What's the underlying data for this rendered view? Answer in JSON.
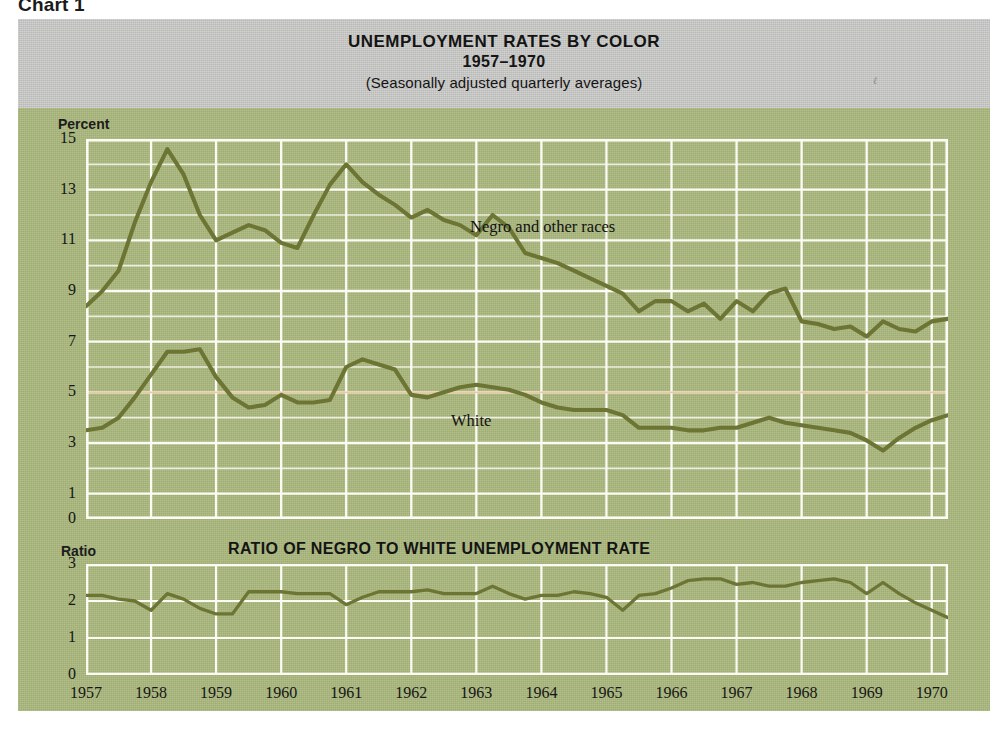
{
  "chart_number": "Chart 1",
  "header": {
    "title_line1": "UNEMPLOYMENT RATES BY COLOR",
    "title_line2": "1957–1970",
    "title_line3": "(Seasonally adjusted quarterly averages)",
    "smudge_mark": "ℓ"
  },
  "colors": {
    "page_background": "#ffffff",
    "figure_background": "#aab87d",
    "header_band": "#c9c9c7",
    "line": "#6d7535",
    "gridline": "#fbfbf4",
    "reference_line": "#e8c39a",
    "text": "#141414"
  },
  "main_panel": {
    "y_axis_caption": "Percent",
    "y_tick_labels": [
      "15",
      "13",
      "11",
      "9",
      "7",
      "5",
      "3",
      "1",
      "0"
    ],
    "series_label_negro": "Negro and other races",
    "series_label_white": "White"
  },
  "ratio_panel": {
    "y_axis_caption": "Ratio",
    "panel_title": "RATIO OF NEGRO TO WHITE UNEMPLOYMENT RATE",
    "y_tick_labels": [
      "3",
      "2",
      "1",
      "0"
    ]
  },
  "x_axis": {
    "tick_labels": [
      "1957",
      "1958",
      "1959",
      "1960",
      "1961",
      "1962",
      "1963",
      "1964",
      "1965",
      "1966",
      "1967",
      "1968",
      "1969",
      "1970"
    ]
  },
  "chart_data": [
    {
      "type": "line",
      "title": "UNEMPLOYMENT RATES BY COLOR",
      "subtitle": "1957–1970 (Seasonally adjusted quarterly averages)",
      "xlabel": "",
      "ylabel": "Percent",
      "ylim": [
        0,
        15
      ],
      "xlim": [
        1957.0,
        1970.25
      ],
      "grid": true,
      "legend": "inline annotations",
      "x": [
        1957.0,
        1957.25,
        1957.5,
        1957.75,
        1958.0,
        1958.25,
        1958.5,
        1958.75,
        1959.0,
        1959.25,
        1959.5,
        1959.75,
        1960.0,
        1960.25,
        1960.5,
        1960.75,
        1961.0,
        1961.25,
        1961.5,
        1961.75,
        1962.0,
        1962.25,
        1962.5,
        1962.75,
        1963.0,
        1963.25,
        1963.5,
        1963.75,
        1964.0,
        1964.25,
        1964.5,
        1964.75,
        1965.0,
        1965.25,
        1965.5,
        1965.75,
        1966.0,
        1966.25,
        1966.5,
        1966.75,
        1967.0,
        1967.25,
        1967.5,
        1967.75,
        1968.0,
        1968.25,
        1968.5,
        1968.75,
        1969.0,
        1969.25,
        1969.5,
        1969.75,
        1970.0,
        1970.25
      ],
      "series": [
        {
          "name": "Negro and other races",
          "values": [
            8.4,
            9.0,
            9.8,
            11.7,
            13.3,
            14.6,
            13.6,
            12.0,
            11.0,
            11.3,
            11.6,
            11.4,
            10.9,
            10.7,
            12.0,
            13.2,
            14.0,
            13.3,
            12.8,
            12.4,
            11.9,
            12.2,
            11.8,
            11.6,
            11.2,
            12.0,
            11.5,
            10.5,
            10.3,
            10.1,
            9.8,
            9.5,
            9.2,
            8.9,
            8.2,
            8.6,
            8.6,
            8.2,
            8.5,
            7.9,
            8.6,
            8.2,
            8.9,
            9.1,
            7.8,
            7.7,
            7.5,
            7.6,
            7.2,
            7.8,
            7.5,
            7.4,
            7.8,
            7.9
          ]
        },
        {
          "name": "White",
          "values": [
            3.5,
            3.6,
            4.0,
            4.8,
            5.7,
            6.6,
            6.6,
            6.7,
            5.6,
            4.8,
            4.4,
            4.5,
            4.9,
            4.6,
            4.6,
            4.7,
            6.0,
            6.3,
            6.1,
            5.9,
            4.9,
            4.8,
            5.0,
            5.2,
            5.3,
            5.2,
            5.1,
            4.9,
            4.6,
            4.4,
            4.3,
            4.3,
            4.3,
            4.1,
            3.6,
            3.6,
            3.6,
            3.5,
            3.5,
            3.6,
            3.6,
            3.8,
            4.0,
            3.8,
            3.7,
            3.6,
            3.5,
            3.4,
            3.1,
            2.7,
            3.2,
            3.6,
            3.9,
            4.1
          ]
        }
      ]
    },
    {
      "type": "line",
      "title": "RATIO OF NEGRO TO WHITE UNEMPLOYMENT RATE",
      "xlabel": "",
      "ylabel": "Ratio",
      "ylim": [
        0,
        3
      ],
      "xlim": [
        1957.0,
        1970.25
      ],
      "grid": true,
      "x": [
        1957.0,
        1957.25,
        1957.5,
        1957.75,
        1958.0,
        1958.25,
        1958.5,
        1958.75,
        1959.0,
        1959.25,
        1959.5,
        1959.75,
        1960.0,
        1960.25,
        1960.5,
        1960.75,
        1961.0,
        1961.25,
        1961.5,
        1961.75,
        1962.0,
        1962.25,
        1962.5,
        1962.75,
        1963.0,
        1963.25,
        1963.5,
        1963.75,
        1964.0,
        1964.25,
        1964.5,
        1964.75,
        1965.0,
        1965.25,
        1965.5,
        1965.75,
        1966.0,
        1966.25,
        1966.5,
        1966.75,
        1967.0,
        1967.25,
        1967.5,
        1967.75,
        1968.0,
        1968.25,
        1968.5,
        1968.75,
        1969.0,
        1969.25,
        1969.5,
        1969.75,
        1970.0,
        1970.25
      ],
      "series": [
        {
          "name": "Ratio of Negro to White unemployment rate",
          "values": [
            2.15,
            2.15,
            2.05,
            2.0,
            1.75,
            2.2,
            2.05,
            1.8,
            1.65,
            1.65,
            2.25,
            2.25,
            2.25,
            2.2,
            2.2,
            2.2,
            1.9,
            2.1,
            2.25,
            2.25,
            2.25,
            2.3,
            2.2,
            2.2,
            2.2,
            2.4,
            2.2,
            2.05,
            2.15,
            2.15,
            2.25,
            2.2,
            2.1,
            1.75,
            2.15,
            2.2,
            2.35,
            2.55,
            2.6,
            2.6,
            2.45,
            2.5,
            2.4,
            2.4,
            2.5,
            2.55,
            2.6,
            2.5,
            2.2,
            2.5,
            2.2,
            1.95,
            1.75,
            1.55
          ]
        }
      ]
    }
  ]
}
